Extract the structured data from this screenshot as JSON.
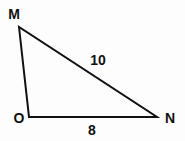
{
  "diagram": {
    "type": "triangle",
    "vertices": [
      {
        "name": "M",
        "x": 19,
        "y": 27,
        "label_x": 14,
        "label_y": 14
      },
      {
        "name": "O",
        "x": 29,
        "y": 117,
        "label_x": 19,
        "label_y": 118
      },
      {
        "name": "N",
        "x": 157,
        "y": 117,
        "label_x": 170,
        "label_y": 118
      }
    ],
    "sides": [
      {
        "from": "M",
        "to": "N",
        "length_label": "10",
        "label_x": 98,
        "label_y": 60
      },
      {
        "from": "O",
        "to": "N",
        "length_label": "8",
        "label_x": 92,
        "label_y": 130
      },
      {
        "from": "M",
        "to": "O",
        "length_label": ""
      }
    ],
    "stroke_color": "#111111"
  }
}
